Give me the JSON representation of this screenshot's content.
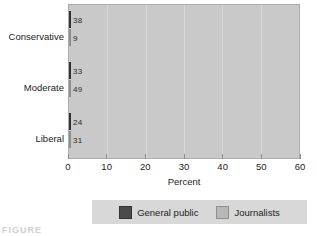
{
  "chart_data": {
    "type": "bar",
    "orientation": "horizontal",
    "title": "",
    "xlabel": "Percent",
    "ylabel": "",
    "xlim": [
      0,
      60
    ],
    "xticks": [
      0,
      10,
      20,
      30,
      40,
      50,
      60
    ],
    "grid": true,
    "legend_position": "bottom",
    "categories": [
      "Conservative",
      "Moderate",
      "Liberal"
    ],
    "series": [
      {
        "name": "General public",
        "color": "#4a4a4a",
        "values": [
          38,
          33,
          24
        ]
      },
      {
        "name": "Journalists",
        "color": "#b8b8b8",
        "values": [
          9,
          49,
          31
        ]
      }
    ],
    "value_labels": [
      [
        "38",
        "9"
      ],
      [
        "33",
        "49"
      ],
      [
        "24",
        "31"
      ]
    ]
  },
  "axis": {
    "x_title": "Percent",
    "tick_labels": [
      "0",
      "10",
      "20",
      "30",
      "40",
      "50",
      "60"
    ],
    "category_labels": [
      "Conservative",
      "Moderate",
      "Liberal"
    ]
  },
  "legend": {
    "entries": [
      {
        "label": "General public"
      },
      {
        "label": "Journalists"
      }
    ]
  },
  "caption": {
    "text": "FIGURE"
  },
  "colors": {
    "series_dark": "#4a4a4a",
    "series_light": "#b8b8b8",
    "plot_background": "#c9c9c9",
    "legend_background": "#d8d8d8",
    "page_background": "#ffffff"
  }
}
